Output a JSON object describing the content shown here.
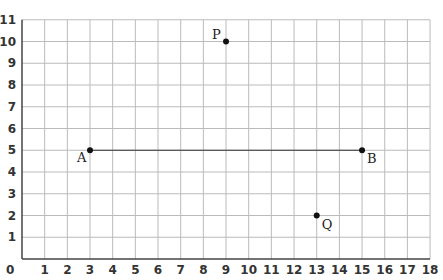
{
  "chart_data": {
    "type": "scatter",
    "title": "",
    "xlabel": "",
    "ylabel": "",
    "xlim": [
      0,
      18
    ],
    "ylim": [
      0,
      11
    ],
    "grid": true,
    "x_ticks": [
      0,
      1,
      2,
      3,
      4,
      5,
      6,
      7,
      8,
      9,
      10,
      11,
      12,
      13,
      14,
      15,
      16,
      17,
      18
    ],
    "y_ticks": [
      1,
      2,
      3,
      4,
      5,
      6,
      7,
      8,
      9,
      10,
      11
    ],
    "points": [
      {
        "label": "A",
        "x": 3,
        "y": 5
      },
      {
        "label": "B",
        "x": 15,
        "y": 5
      },
      {
        "label": "P",
        "x": 9,
        "y": 10
      },
      {
        "label": "Q",
        "x": 13,
        "y": 2
      }
    ],
    "segments": [
      {
        "from": "A",
        "to": "B"
      }
    ],
    "colors": {
      "grid": "#bbbbbb",
      "axis": "#444444",
      "point": "#111111",
      "segment": "#333333"
    }
  }
}
